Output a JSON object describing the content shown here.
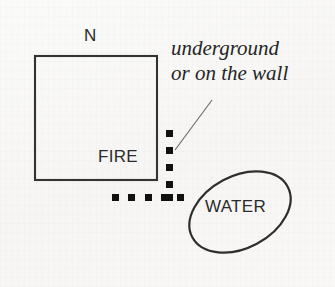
{
  "diagram": {
    "background_color": "#f7f7f5",
    "ink_color": "#2b2b2b",
    "building": {
      "label_north": "N",
      "label_fire": "FIRE",
      "shape": "square",
      "x": 34,
      "y": 55,
      "width": 123,
      "height": 125
    },
    "water": {
      "label": "WATER",
      "shape": "ellipse",
      "cx": 240,
      "cy": 212,
      "rx": 54,
      "ry": 36,
      "rotation_deg": -28
    },
    "annotation": {
      "line1": "underground",
      "line2": "or on the wall",
      "style": "italic-serif"
    },
    "pipe": {
      "name": "dotted-pipe-run",
      "marker": "square",
      "marker_size": 7,
      "color": "#111111",
      "vertical_run": {
        "x": 169,
        "y_start": 130,
        "count": 5,
        "spacing": 17
      },
      "horizontal_run": {
        "y": 195,
        "x_start": 112,
        "count": 5,
        "spacing": 16.5
      }
    },
    "leader_line": {
      "x1": 175,
      "y1": 150,
      "x2": 212,
      "y2": 100
    }
  }
}
